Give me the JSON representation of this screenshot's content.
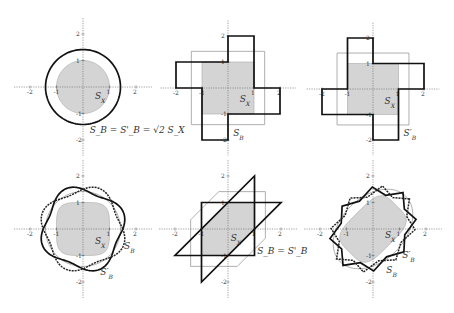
{
  "figure": {
    "panels": [
      {
        "id": "p1",
        "center": [
          83,
          87
        ],
        "unit": 26.5,
        "labels": {
          "sx": "S_X",
          "sb": "S_B = S'_B = √2 S_X"
        }
      },
      {
        "id": "p2",
        "center": [
          228,
          88
        ],
        "unit": 26,
        "labels": {
          "sx": "S_X",
          "sb": "S_B"
        }
      },
      {
        "id": "p3",
        "center": [
          373,
          89
        ],
        "unit": 25.5,
        "labels": {
          "sx": "S_X",
          "sb": "S'_B"
        }
      },
      {
        "id": "p4",
        "center": [
          83,
          229
        ],
        "unit": 26.5,
        "labels": {
          "sx": "S_X",
          "sb": "S_B",
          "sbp": "S'_B"
        }
      },
      {
        "id": "p5",
        "center": [
          228,
          229
        ],
        "unit": 26.5,
        "labels": {
          "sx": "S_X",
          "sb": "S_B = S'_B"
        }
      },
      {
        "id": "p6",
        "center": [
          373,
          229
        ],
        "unit": 26.5,
        "labels": {
          "sx": "S_X",
          "sb": "S_B",
          "sbp": "S'_B"
        }
      }
    ],
    "tick_labels": [
      "-2",
      "-1",
      "1",
      "2"
    ],
    "colors": {
      "shade": "#d4d4d4",
      "thin": "#9a9a9a",
      "bold": "#111111",
      "axis": "#777777"
    }
  }
}
